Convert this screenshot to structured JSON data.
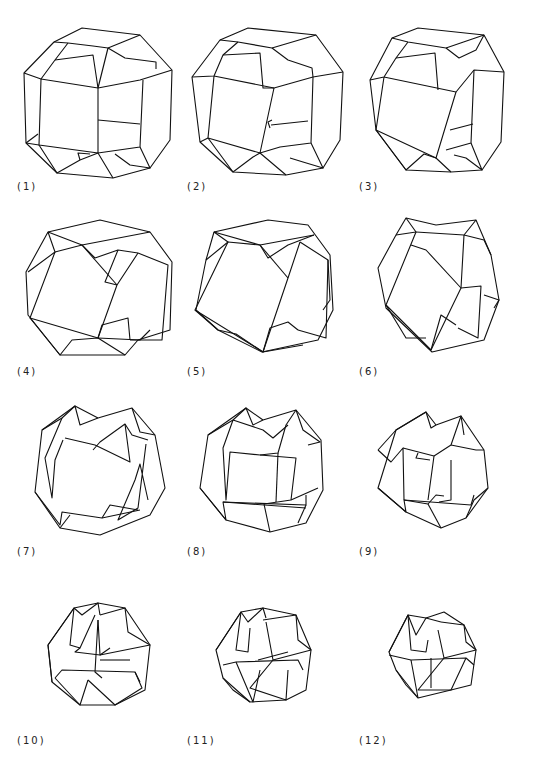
{
  "figure": {
    "panels": [
      {
        "label": "(1)"
      },
      {
        "label": "(2)"
      },
      {
        "label": "(3)"
      },
      {
        "label": "(4)"
      },
      {
        "label": "(5)"
      },
      {
        "label": "(6)"
      },
      {
        "label": "(7)"
      },
      {
        "label": "(8)"
      },
      {
        "label": "(9)"
      },
      {
        "label": "(10)"
      },
      {
        "label": "(11)"
      },
      {
        "label": "(12)"
      }
    ]
  }
}
